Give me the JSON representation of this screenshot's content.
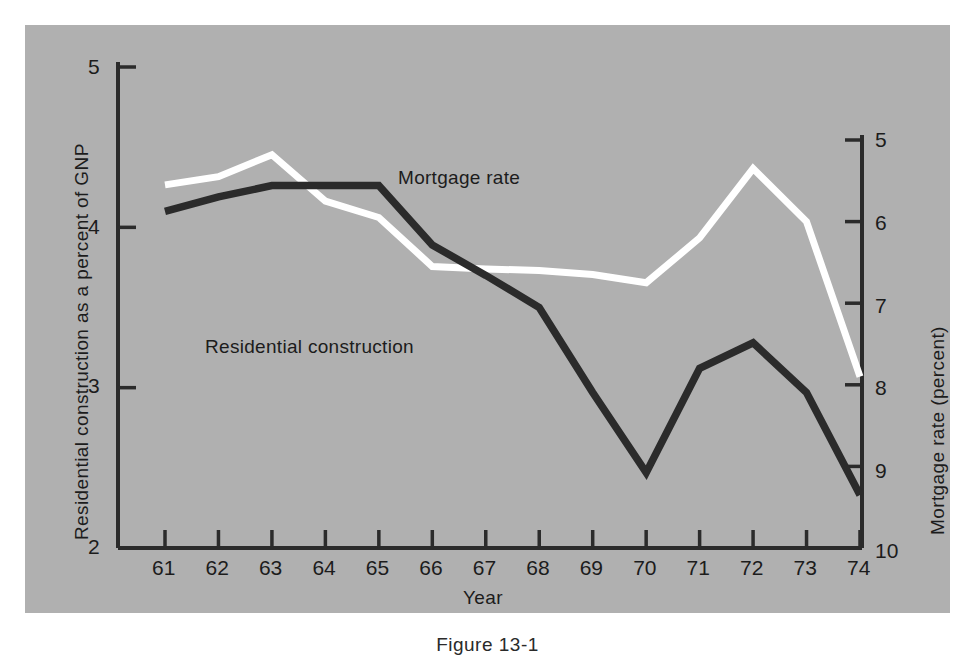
{
  "figure": {
    "caption": "Figure 13-1",
    "panel_color": "#b0b0b0",
    "ink_color": "#2b2b2b",
    "highlight_color": "#ffffff"
  },
  "chart_data": {
    "type": "line",
    "title": "",
    "subtitle": "",
    "xlabel": "Year",
    "categories": [
      "61",
      "62",
      "63",
      "64",
      "65",
      "66",
      "67",
      "68",
      "69",
      "70",
      "71",
      "72",
      "73",
      "74"
    ],
    "x": [
      61,
      62,
      63,
      64,
      65,
      66,
      67,
      68,
      69,
      70,
      71,
      72,
      73,
      74
    ],
    "grid": false,
    "legend_position": "inline-annotation",
    "axes": {
      "left": {
        "label": "Residential construction as a percent of GNP",
        "ticks": [
          "5",
          "4",
          "3",
          "2"
        ],
        "tick_values": [
          5,
          4,
          3,
          2
        ],
        "lim": [
          2,
          5
        ],
        "inverted": false
      },
      "right": {
        "label": "Mortgage rate (percent)",
        "ticks": [
          "5",
          "6",
          "7",
          "8",
          "9",
          "10"
        ],
        "tick_values": [
          5,
          6,
          7,
          8,
          9,
          10
        ],
        "lim": [
          5,
          10
        ],
        "inverted": true
      },
      "x": {
        "label": "Year",
        "ticks": [
          "61",
          "62",
          "63",
          "64",
          "65",
          "66",
          "67",
          "68",
          "69",
          "70",
          "71",
          "72",
          "73",
          "74"
        ],
        "lim": [
          61,
          74
        ]
      }
    },
    "series": [
      {
        "name": "Residential construction",
        "axis": "left",
        "color": "#2b2b2b",
        "unit": "percent of GNP",
        "label_text": "Residential construction",
        "values": [
          4.1,
          4.19,
          4.26,
          4.26,
          4.26,
          3.89,
          3.7,
          3.5,
          2.97,
          2.47,
          3.12,
          3.28,
          2.97,
          2.33
        ]
      },
      {
        "name": "Mortgage rate",
        "axis": "right",
        "color": "#ffffff",
        "unit": "percent",
        "label_text": "Mortgage rate",
        "values": [
          5.55,
          5.45,
          5.18,
          5.75,
          5.95,
          6.55,
          6.58,
          6.6,
          6.65,
          6.75,
          6.2,
          5.35,
          6.0,
          7.9
        ]
      }
    ],
    "annotations": [
      {
        "text": "Mortgage rate",
        "for": "Mortgage rate",
        "x": 398,
        "y": 168
      },
      {
        "text": "Residential construction",
        "for": "Residential construction",
        "x": 205,
        "y": 337
      }
    ]
  }
}
